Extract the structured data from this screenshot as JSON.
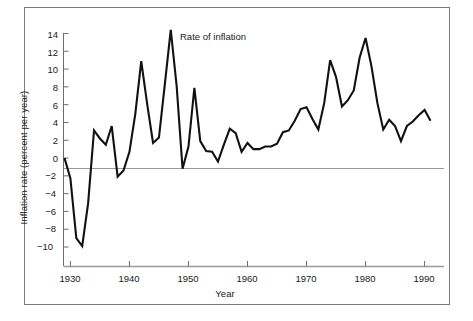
{
  "figure": {
    "annotation": "Rate of inflation",
    "xlabel": "Year",
    "ylabel": "Inflation rate (percent per year)"
  },
  "axes": {
    "y_ticks": [
      "14",
      "12",
      "10",
      "8",
      "6",
      "4",
      "2",
      "0",
      "−2",
      "−4",
      "−6",
      "−8",
      "−10"
    ],
    "x_ticks": [
      "1930",
      "1940",
      "1950",
      "1960",
      "1970",
      "1980",
      "1990"
    ]
  },
  "colors": {
    "line": "#111111",
    "axis": "#808080",
    "frame": "#7b7b7b",
    "text": "#1a1a1a",
    "background": "#ffffff"
  },
  "chart_data": {
    "type": "line",
    "title": "Rate of inflation",
    "xlabel": "Year",
    "ylabel": "Inflation rate (percent per year)",
    "xlim": [
      1929,
      1991
    ],
    "ylim": [
      -10,
      14
    ],
    "grid": false,
    "legend": "none",
    "annotations": [
      {
        "text": "Rate of inflation",
        "x": 1947,
        "y": 13.5
      }
    ],
    "x": [
      1929,
      1930,
      1931,
      1932,
      1933,
      1934,
      1935,
      1936,
      1937,
      1938,
      1939,
      1940,
      1941,
      1942,
      1943,
      1944,
      1945,
      1946,
      1947,
      1948,
      1949,
      1950,
      1951,
      1952,
      1953,
      1954,
      1955,
      1956,
      1957,
      1958,
      1959,
      1960,
      1961,
      1962,
      1963,
      1964,
      1965,
      1966,
      1967,
      1968,
      1969,
      1970,
      1971,
      1972,
      1973,
      1974,
      1975,
      1976,
      1977,
      1978,
      1979,
      1980,
      1981,
      1982,
      1983,
      1984,
      1985,
      1986,
      1987,
      1988,
      1989,
      1990,
      1991
    ],
    "y": [
      0.0,
      -2.3,
      -9.0,
      -9.9,
      -5.1,
      3.1,
      2.2,
      1.5,
      3.6,
      -2.1,
      -1.4,
      0.7,
      5.0,
      10.9,
      6.1,
      1.7,
      2.3,
      8.3,
      14.4,
      8.1,
      -1.2,
      1.3,
      7.9,
      1.9,
      0.8,
      0.7,
      -0.4,
      1.5,
      3.3,
      2.8,
      0.7,
      1.7,
      1.0,
      1.0,
      1.3,
      1.3,
      1.6,
      2.9,
      3.1,
      4.2,
      5.5,
      5.7,
      4.4,
      3.2,
      6.2,
      11.0,
      9.1,
      5.8,
      6.5,
      7.6,
      11.3,
      13.5,
      10.3,
      6.2,
      3.2,
      4.3,
      3.6,
      1.9,
      3.6,
      4.1,
      4.8,
      5.4,
      4.2
    ],
    "series": [
      {
        "name": "Rate of inflation",
        "values": [
          0.0,
          -2.3,
          -9.0,
          -9.9,
          -5.1,
          3.1,
          2.2,
          1.5,
          3.6,
          -2.1,
          -1.4,
          0.7,
          5.0,
          10.9,
          6.1,
          1.7,
          2.3,
          8.3,
          14.4,
          8.1,
          -1.2,
          1.3,
          7.9,
          1.9,
          0.8,
          0.7,
          -0.4,
          1.5,
          3.3,
          2.8,
          0.7,
          1.7,
          1.0,
          1.0,
          1.3,
          1.3,
          1.6,
          2.9,
          3.1,
          4.2,
          5.5,
          5.7,
          4.4,
          3.2,
          6.2,
          11.0,
          9.1,
          5.8,
          6.5,
          7.6,
          11.3,
          13.5,
          10.3,
          6.2,
          3.2,
          4.3,
          3.6,
          1.9,
          3.6,
          4.1,
          4.8,
          5.4,
          4.2
        ]
      }
    ]
  }
}
